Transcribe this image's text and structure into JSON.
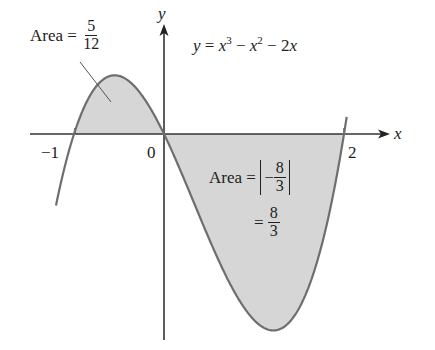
{
  "figure": {
    "equation": {
      "lhs": "y",
      "eq": " = ",
      "t1": "x",
      "e1": "3",
      "op1": " − ",
      "t2": "x",
      "e2": "2",
      "op2": " − 2",
      "t3": "x"
    },
    "axes": {
      "x_label": "x",
      "y_label": "y",
      "ticks": [
        {
          "label": "−1",
          "value": -1
        },
        {
          "label": "0",
          "value": 0
        },
        {
          "label": "2",
          "value": 2
        }
      ]
    },
    "region_left": {
      "prefix": "Area = ",
      "numerator": "5",
      "denominator": "12",
      "interval": [
        -1,
        0
      ]
    },
    "region_right": {
      "prefix": "Area = ",
      "abs_sign": "−",
      "abs_numerator": "8",
      "abs_denominator": "3",
      "second_prefix": "= ",
      "numerator": "8",
      "denominator": "3",
      "interval": [
        0,
        2
      ]
    },
    "colors": {
      "curve": "#6e6e6e",
      "shade": "#d6d6d6",
      "axis": "#333333"
    }
  }
}
